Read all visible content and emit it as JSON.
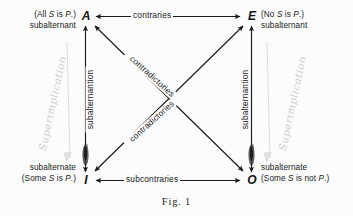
{
  "figure": {
    "caption": "Fig.  1",
    "background_color": "#fcfcfc",
    "ink_color": "#181818",
    "pencil_color": "#c9c9c9"
  },
  "vertices": {
    "A": {
      "letter": "A",
      "proposition": "(All S is P.)",
      "role": "subalternant"
    },
    "E": {
      "letter": "E",
      "proposition": "(No S is P.)",
      "role": "subalternant"
    },
    "I": {
      "letter": "I",
      "proposition": "(Some S is P.)",
      "role": "subalternate"
    },
    "O": {
      "letter": "O",
      "proposition": "(Some S is not P.)",
      "role": "subalternate"
    }
  },
  "relations": {
    "top": "contraries",
    "bottom": "subcontraries",
    "left_vertical": "subalternantion",
    "right_vertical": "subalternantion",
    "diagonal_upper": "contradictories",
    "diagonal_lower": "contradictories"
  },
  "annotations": {
    "left_script": "Superimplication",
    "right_script": "Superimplication"
  }
}
